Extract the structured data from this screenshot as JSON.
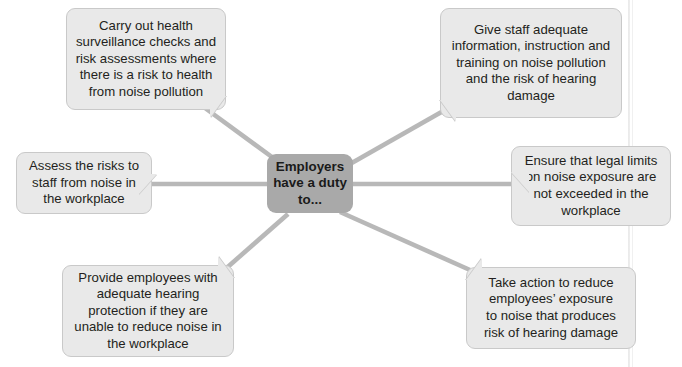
{
  "diagram": {
    "type": "spider-diagram",
    "center": {
      "label": "Employers\nhave a duty\nto...",
      "fill": "#a9a9a9"
    },
    "node_fill": "#e9e9e9",
    "node_border": "#c9c9c9",
    "connector_color": "#b8b8b8",
    "nodes": [
      {
        "id": "health-surveillance",
        "position": "top-left",
        "tail": "bottom-right",
        "label": "Carry out health\nsurveillance checks and\nrisk assessments where\nthere is a risk to health\nfrom noise pollution"
      },
      {
        "id": "information-training",
        "position": "top-right",
        "tail": "bottom-left",
        "label": "Give staff adequate\ninformation, instruction and\ntraining on noise pollution\nand the risk of hearing\ndamage"
      },
      {
        "id": "assess-risks",
        "position": "middle-left",
        "tail": "right",
        "label": "Assess the risks to\nstaff from noise in\nthe workplace"
      },
      {
        "id": "legal-limits",
        "position": "middle-right",
        "tail": "left",
        "label": "Ensure that legal limits\non noise exposure are\nnot exceeded in the\nworkplace"
      },
      {
        "id": "hearing-protection",
        "position": "bottom-left",
        "tail": "top-right",
        "label": "Provide employees with\nadequate hearing\nprotection if they are\nunable to reduce noise in\nthe workplace"
      },
      {
        "id": "reduce-exposure",
        "position": "bottom-right",
        "tail": "top-left",
        "label": "Take action to reduce\nemployees’ exposure\nto noise that produces\nrisk of hearing damage"
      }
    ]
  }
}
